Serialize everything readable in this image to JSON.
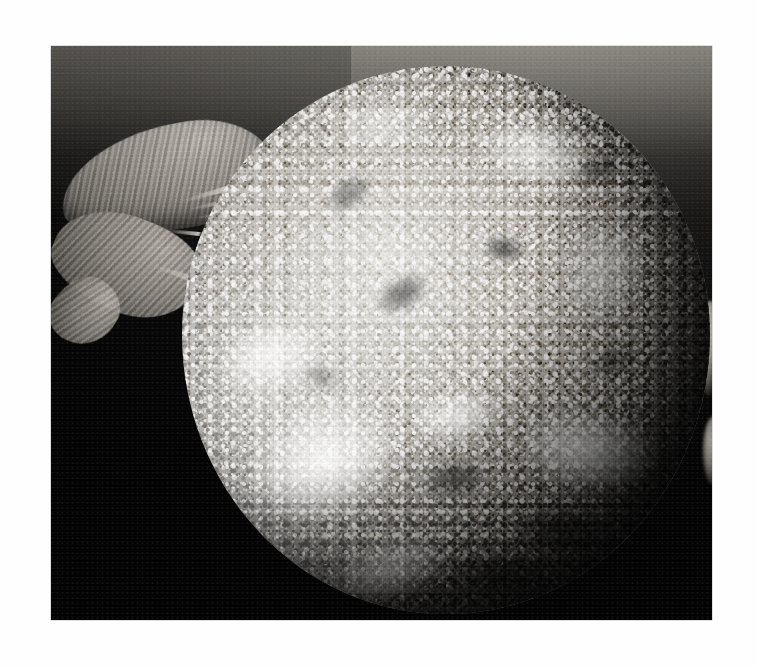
{
  "page": {
    "background_color": "#ffffff",
    "width": 757,
    "height": 667
  },
  "figure": {
    "name": "micrograph-plate",
    "type": "grayscale-photomicrograph",
    "alt_text": "Grayscale micrograph of a near-spherical specimen with a densely granular, mottled surface, set against a dark field. A torn, fibrous membranous sheet extends from the upper-left side of the sphere, with a black void between the membrane and the sphere wall.",
    "frame": {
      "left": 51,
      "top": 46,
      "width": 661,
      "height": 574
    },
    "field_background_color": "#060606",
    "field_top_haze_color": "#3a3833",
    "specimen": {
      "name": "spherical-specimen",
      "shape": "sphere",
      "center_x": 395,
      "center_y": 294,
      "diameter_px": 528,
      "surface": "dense granular mottled texture with bright plaques and dark pits",
      "highlight_color": "#e8e6e2",
      "midtone_color": "#a9a59e",
      "shadow_color": "#3e3c39",
      "bright_patch_count": 8,
      "dark_blotch_count": 9
    },
    "appendage": {
      "name": "membranous-appendage",
      "position": "upper-left",
      "description": "torn fibrous membrane sheet with frayed strands",
      "color": "#9d988f",
      "strand_count": 6
    },
    "void": {
      "name": "dark-void",
      "description": "black gap between membrane and specimen wall",
      "color": "#000000"
    },
    "nubs": {
      "name": "right-limb-protrusions",
      "count": 2,
      "position": "right limb"
    }
  }
}
